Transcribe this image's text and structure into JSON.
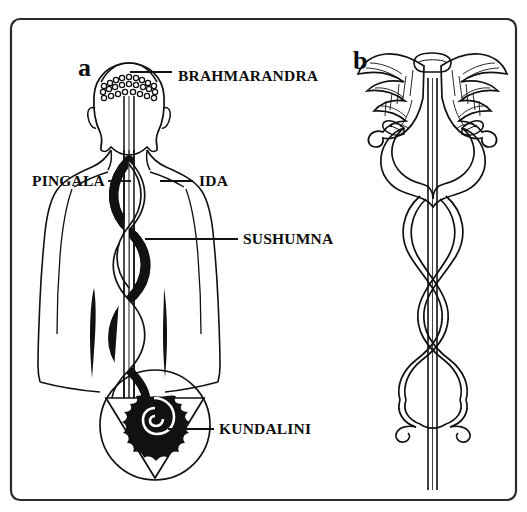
{
  "figure": {
    "background_color": "#ffffff",
    "ink_color": "#111111",
    "frame": {
      "x": 11,
      "y": 19,
      "width": 505,
      "height": 481,
      "corner_radius": 9,
      "stroke_color": "#2b2b2b"
    },
    "panels": [
      {
        "id": "a",
        "letter": "a",
        "letter_x": 78,
        "letter_y": 76,
        "subject": "human-figure-rear-view-with-subtle-energy-channels"
      },
      {
        "id": "b",
        "letter": "b",
        "letter_x": 353,
        "letter_y": 69,
        "subject": "caduceus-winged-staff-with-two-serpents"
      }
    ],
    "callouts": [
      {
        "id": "brahmarandra",
        "label": "BRAHMARANDRA",
        "text_x": 178,
        "text_y": 81,
        "leader": [
          [
            130,
            72
          ],
          [
            172,
            72
          ]
        ],
        "anchor": "crown-of-head"
      },
      {
        "id": "pingala",
        "label": "PINGALA",
        "text_x": 32,
        "text_y": 186,
        "leader": [
          [
            108,
            181
          ],
          [
            131,
            181
          ]
        ],
        "anchor": "left-lateral-channel"
      },
      {
        "id": "ida",
        "label": "IDA",
        "text_x": 199,
        "text_y": 186,
        "leader": [
          [
            160,
            181
          ],
          [
            193,
            181
          ]
        ],
        "anchor": "right-lateral-channel"
      },
      {
        "id": "sushumna",
        "label": "SUSHUMNA",
        "text_x": 243,
        "text_y": 244,
        "leader": [
          [
            145,
            239
          ],
          [
            238,
            239
          ]
        ],
        "anchor": "central-channel"
      },
      {
        "id": "kundalini",
        "label": "KUNDALINI",
        "text_x": 219,
        "text_y": 434,
        "leader": [
          [
            168,
            429
          ],
          [
            214,
            429
          ]
        ],
        "anchor": "coiled-serpent-at-base"
      }
    ]
  }
}
